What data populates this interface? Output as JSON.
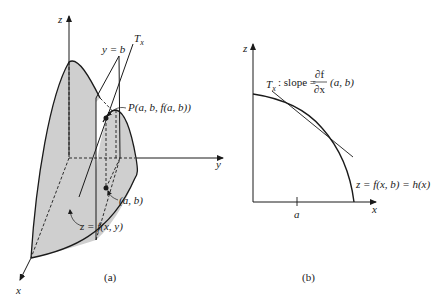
{
  "figure_a": {
    "axis_z": "z",
    "axis_y": "y",
    "axis_x": "x",
    "plane_label": "y = b",
    "tangent_label": "T",
    "tangent_sub": "x",
    "point_label": "P(a, b, f(a, b))",
    "base_point_label": "(a, b)",
    "surface_label": "z = f(x, y)",
    "caption": "(a)",
    "surface_fill": "#cfcfcf"
  },
  "figure_b": {
    "axis_z": "z",
    "axis_x": "x",
    "tick_label": "a",
    "tangent_label": "T",
    "tangent_sub": "x",
    "slope_text": ": slope =",
    "frac_num": "∂f",
    "frac_den": "∂x",
    "slope_args": "(a, b)",
    "curve_label": "z = f(x, b) = h(x)",
    "caption": "(b)"
  }
}
